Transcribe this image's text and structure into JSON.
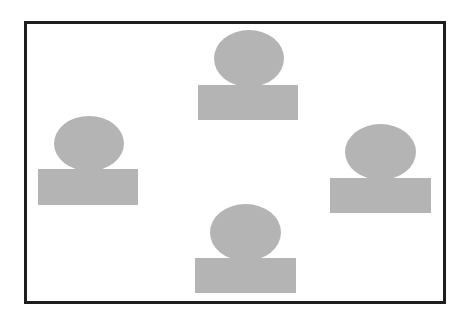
{
  "diagram": {
    "frame": {
      "left": 24,
      "top": 21,
      "width": 416,
      "height": 277,
      "border_color": "#1e1e1e"
    },
    "fill_color": "#b4b4b4",
    "figures": [
      {
        "name": "top",
        "ellipse": {
          "x": 214,
          "y": 30,
          "w": 70,
          "h": 57
        },
        "rect": {
          "x": 198,
          "y": 85,
          "w": 100,
          "h": 35
        }
      },
      {
        "name": "left",
        "ellipse": {
          "x": 54,
          "y": 116,
          "w": 70,
          "h": 55
        },
        "rect": {
          "x": 38,
          "y": 169,
          "w": 100,
          "h": 36
        }
      },
      {
        "name": "right",
        "ellipse": {
          "x": 345,
          "y": 124,
          "w": 71,
          "h": 56
        },
        "rect": {
          "x": 330,
          "y": 178,
          "w": 101,
          "h": 35
        }
      },
      {
        "name": "bottom",
        "ellipse": {
          "x": 210,
          "y": 204,
          "w": 71,
          "h": 57
        },
        "rect": {
          "x": 195,
          "y": 258,
          "w": 101,
          "h": 35
        }
      }
    ]
  }
}
